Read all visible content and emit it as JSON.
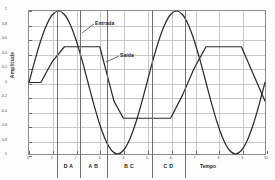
{
  "chart_data": {
    "type": "line",
    "title": "",
    "xlabel": "Tempo",
    "ylabel": "Amplitude",
    "xlim": [
      0,
      10
    ],
    "ylim": [
      -1,
      1
    ],
    "grid": true,
    "legend_position": "inline-annotations",
    "xticks": [
      "0",
      "1",
      "2",
      "3",
      "4",
      "5",
      "6",
      "7",
      "8",
      "9",
      "10"
    ],
    "yticks": [
      "1",
      "0,8",
      "0,6",
      "0,4",
      "0,2",
      "0",
      "-0,2",
      "-0,4",
      "-0,6",
      "-0,8",
      "-1"
    ],
    "series": [
      {
        "name": "Entrada",
        "description": "Sinal senoidal de entrada, amplitude 1, periodo 5",
        "x": [
          0.0,
          0.25,
          0.5,
          0.75,
          1.0,
          1.25,
          1.5,
          1.75,
          2.0,
          2.25,
          2.5,
          2.75,
          3.0,
          3.25,
          3.5,
          3.75,
          4.0,
          4.25,
          4.5,
          4.75,
          5.0,
          5.25,
          5.5,
          5.75,
          6.0,
          6.25,
          6.5,
          6.75,
          7.0,
          7.25,
          7.5,
          7.75,
          8.0,
          8.25,
          8.5,
          8.75,
          9.0,
          9.25,
          9.5,
          9.75,
          10.0
        ],
        "values": [
          0.0,
          0.309,
          0.588,
          0.809,
          0.951,
          1.0,
          0.951,
          0.809,
          0.588,
          0.309,
          0.0,
          -0.309,
          -0.588,
          -0.809,
          -0.951,
          -1.0,
          -0.951,
          -0.809,
          -0.588,
          -0.309,
          0.0,
          0.309,
          0.588,
          0.809,
          0.951,
          1.0,
          0.951,
          0.809,
          0.588,
          0.309,
          0.0,
          -0.309,
          -0.588,
          -0.809,
          -0.951,
          -1.0,
          -0.951,
          -0.809,
          -0.588,
          -0.309,
          0.0
        ]
      },
      {
        "name": "Saída",
        "description": "Sinal de saida limitado por slew-rate e ceifado em +/-0,5",
        "x": [
          0.0,
          0.5,
          1.0,
          1.5,
          2.0,
          2.5,
          3.0,
          3.3,
          3.6,
          4.0,
          4.5,
          5.0,
          5.5,
          6.0,
          6.5,
          7.0,
          7.5,
          8.0,
          8.3,
          8.6,
          9.0,
          9.5,
          10.0
        ],
        "values": [
          0.0,
          0.0,
          0.3,
          0.5,
          0.5,
          0.5,
          0.5,
          0.12,
          -0.26,
          -0.5,
          -0.5,
          -0.5,
          -0.5,
          -0.5,
          -0.18,
          0.2,
          0.5,
          0.5,
          0.5,
          0.5,
          0.5,
          0.12,
          -0.26
        ]
      }
    ],
    "annotations": [
      {
        "name": "Entrada",
        "label": "Entrada"
      },
      {
        "name": "Saída",
        "label": "Saída"
      }
    ],
    "phase_regions": [
      {
        "label": "D A",
        "start": 1.2,
        "end": 2.2
      },
      {
        "label": "A B",
        "start": 2.2,
        "end": 3.3
      },
      {
        "label": "B C",
        "start": 3.3,
        "end": 5.2
      },
      {
        "label": "C D",
        "start": 5.2,
        "end": 6.6
      }
    ],
    "divider_positions": [
      1.2,
      2.2,
      3.3,
      5.2,
      6.6
    ]
  },
  "colors": {
    "curve": "#2b2b2b",
    "grid": "#c9c9c9",
    "frame": "#8a8a8a",
    "text": "#1a1a1a",
    "background": "#ffffff"
  }
}
